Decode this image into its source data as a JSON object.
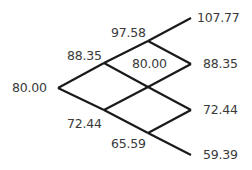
{
  "diagram": {
    "type": "binomial-tree",
    "steps": 3,
    "nodes": {
      "root": {
        "value": "80.00",
        "level": 0
      },
      "up1": {
        "value": "88.35",
        "level": 1
      },
      "down1": {
        "value": "72.44",
        "level": 1
      },
      "upup2": {
        "value": "97.58",
        "level": 2
      },
      "mid2": {
        "value": "80.00",
        "level": 2
      },
      "downdown2": {
        "value": "65.59",
        "level": 2
      },
      "uuu3": {
        "value": "107.77",
        "level": 3
      },
      "uud3": {
        "value": "88.35",
        "level": 3
      },
      "udd3": {
        "value": "72.44",
        "level": 3
      },
      "ddd3": {
        "value": "59.39",
        "level": 3
      }
    },
    "line_color": "#1a1a1a",
    "text_color": "#3a3a3a"
  }
}
